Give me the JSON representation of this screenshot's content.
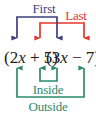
{
  "diagram": {
    "expression": {
      "left_factor": "(2x + 5)",
      "right_factor": "(3x − 7)",
      "full": "(2x + 5)(3x − 7)",
      "terms": [
        {
          "id": "first-left",
          "text": "2x"
        },
        {
          "id": "last-left",
          "text": "5"
        },
        {
          "id": "first-right",
          "text": "3x"
        },
        {
          "id": "last-right",
          "text": "−7"
        }
      ]
    },
    "labels": {
      "first": "First",
      "last": "Last",
      "inside": "Inside",
      "outside": "Outside"
    },
    "colors": {
      "first": "#3c3f7f",
      "last": "#e8342b",
      "inside": "#2d8a6d",
      "outside": "#2d8a6d",
      "expression": "#1a1a1a",
      "background": "#ffffff"
    },
    "connections": [
      {
        "name": "First",
        "from": "2x",
        "to": "3x",
        "color": "#3c3f7f",
        "position": "above"
      },
      {
        "name": "Last",
        "from": "5",
        "to": "−7",
        "color": "#e8342b",
        "position": "above"
      },
      {
        "name": "Inside",
        "from": "5",
        "to": "3x",
        "color": "#2d8a6d",
        "position": "below"
      },
      {
        "name": "Outside",
        "from": "2x",
        "to": "−7",
        "color": "#2d8a6d",
        "position": "below"
      }
    ]
  }
}
